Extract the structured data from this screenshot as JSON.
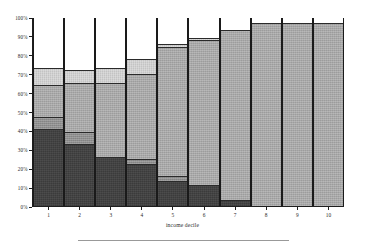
{
  "chart_data": {
    "type": "bar",
    "title": "",
    "subtitle": "",
    "xlabel": "income decile",
    "ylabel": "",
    "stacked": true,
    "stack_mode": "percent",
    "grid": false,
    "legend_position": "none",
    "ylim": [
      0,
      100
    ],
    "ytick_labels": [
      "100%",
      "90%",
      "80%",
      "70%",
      "60%",
      "50%",
      "40%",
      "30%",
      "20%",
      "10%",
      "0%"
    ],
    "ytick_values": [
      100,
      90,
      80,
      70,
      60,
      50,
      40,
      30,
      20,
      10,
      0
    ],
    "categories": [
      "1",
      "2",
      "3",
      "4",
      "5",
      "6",
      "7",
      "8",
      "9",
      "10"
    ],
    "series": [
      {
        "name": "segment-1-darkest",
        "color": "#3b3b3b",
        "values": [
          41,
          33,
          26,
          22,
          13,
          11,
          3,
          0,
          0,
          0
        ]
      },
      {
        "name": "segment-2-mid-dark",
        "color": "#8e8e8e",
        "values": [
          6,
          6,
          0,
          3,
          3,
          0,
          0,
          0,
          0,
          0
        ]
      },
      {
        "name": "segment-3-mid",
        "color": "#a8a8a8",
        "values": [
          17,
          26,
          39,
          45,
          68,
          77,
          90,
          97,
          97,
          97
        ]
      },
      {
        "name": "segment-4-light",
        "color": "#d2d2d2",
        "values": [
          9,
          7,
          8,
          8,
          2,
          1,
          0,
          0,
          0,
          0
        ]
      },
      {
        "name": "segment-5-white",
        "color": "#ffffff",
        "values": [
          27,
          28,
          27,
          22,
          14,
          11,
          7,
          3,
          3,
          3
        ]
      }
    ],
    "cumulative_tops": [
      73,
      72,
      73,
      78,
      86,
      89,
      93,
      97,
      97,
      97
    ]
  },
  "axis": {
    "x_title": "income decile"
  },
  "caption": {
    "rule_visible": true
  }
}
